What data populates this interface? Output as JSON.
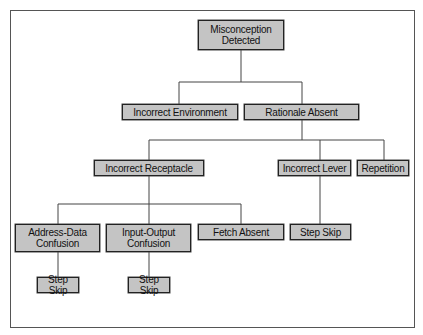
{
  "diagram": {
    "type": "tree",
    "nodes": [
      {
        "id": "root",
        "label": "Misconception Detected",
        "line1": "Misconception",
        "line2": "Detected"
      },
      {
        "id": "env",
        "label": "Incorrect Environment"
      },
      {
        "id": "rat",
        "label": "Rationale Absent"
      },
      {
        "id": "rec",
        "label": "Incorrect Receptacle"
      },
      {
        "id": "lev",
        "label": "Incorrect Lever"
      },
      {
        "id": "rep",
        "label": "Repetition"
      },
      {
        "id": "adc",
        "label": "Address-Data Confusion",
        "line1": "Address-Data",
        "line2": "Confusion"
      },
      {
        "id": "ioc",
        "label": "Input-Output Confusion",
        "line1": "Input-Output",
        "line2": "Confusion"
      },
      {
        "id": "fet",
        "label": "Fetch Absent"
      },
      {
        "id": "ss1",
        "label": "Step Skip"
      },
      {
        "id": "ss2",
        "label": "Step Skip"
      },
      {
        "id": "ss3",
        "label": "Step Skip"
      }
    ],
    "edges": [
      [
        "root",
        "env"
      ],
      [
        "root",
        "rat"
      ],
      [
        "rat",
        "rec"
      ],
      [
        "rat",
        "lev"
      ],
      [
        "rat",
        "rep"
      ],
      [
        "rec",
        "adc"
      ],
      [
        "rec",
        "ioc"
      ],
      [
        "rec",
        "fet"
      ],
      [
        "lev",
        "ss3"
      ],
      [
        "adc",
        "ss1"
      ],
      [
        "ioc",
        "ss2"
      ]
    ]
  }
}
